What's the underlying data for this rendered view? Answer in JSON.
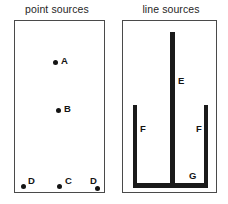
{
  "figure": {
    "background_color": "#ffffff",
    "ink_color": "#1a1a1a",
    "enclosure_border_color": "#4a4a4a"
  },
  "panels": [
    {
      "id": "point-sources",
      "title": "point sources",
      "sources": [
        {
          "label": "A",
          "type": "point"
        },
        {
          "label": "B",
          "type": "point"
        },
        {
          "label": "C",
          "type": "point"
        },
        {
          "label": "D",
          "type": "point"
        },
        {
          "label": "D",
          "type": "point"
        }
      ]
    },
    {
      "id": "line-sources",
      "title": "line sources",
      "sources": [
        {
          "label": "E",
          "type": "line",
          "orientation": "vertical"
        },
        {
          "label": "F",
          "type": "line",
          "orientation": "vertical"
        },
        {
          "label": "F",
          "type": "line",
          "orientation": "vertical"
        },
        {
          "label": "G",
          "type": "line",
          "orientation": "horizontal"
        }
      ]
    }
  ]
}
